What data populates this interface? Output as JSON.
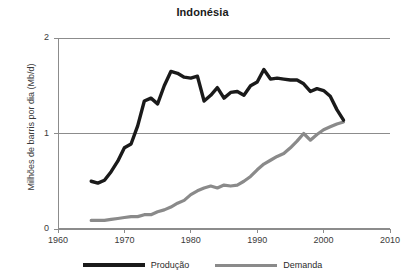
{
  "chart_data": {
    "type": "line",
    "title": "Indonésia",
    "xlabel": "",
    "ylabel": "Milhões de barris por dia (Mb/d)",
    "xlim": [
      1960,
      2010
    ],
    "ylim": [
      0,
      2
    ],
    "xticks": [
      1960,
      1970,
      1980,
      1990,
      2000,
      2010
    ],
    "yticks": [
      0,
      1,
      2
    ],
    "grid": "horizontal gridlines at y = 1 and y = 2 (plot top border)",
    "legend_position": "bottom-center",
    "series": [
      {
        "name": "Produção",
        "color": "#1a1a1a",
        "x": [
          1965,
          1966,
          1967,
          1968,
          1969,
          1970,
          1971,
          1972,
          1973,
          1974,
          1975,
          1976,
          1977,
          1978,
          1979,
          1980,
          1981,
          1982,
          1983,
          1984,
          1985,
          1986,
          1987,
          1988,
          1989,
          1990,
          1991,
          1992,
          1993,
          1994,
          1995,
          1996,
          1997,
          1998,
          1999,
          2000,
          2001,
          2002,
          2003
        ],
        "values": [
          0.5,
          0.48,
          0.51,
          0.6,
          0.71,
          0.85,
          0.89,
          1.08,
          1.34,
          1.37,
          1.31,
          1.5,
          1.65,
          1.63,
          1.59,
          1.58,
          1.6,
          1.34,
          1.4,
          1.48,
          1.37,
          1.43,
          1.44,
          1.4,
          1.5,
          1.54,
          1.67,
          1.57,
          1.58,
          1.57,
          1.56,
          1.56,
          1.52,
          1.44,
          1.47,
          1.45,
          1.39,
          1.25,
          1.14
        ],
        "units": "Mb/d"
      },
      {
        "name": "Demanda",
        "color": "#8a8a8a",
        "x": [
          1965,
          1966,
          1967,
          1968,
          1969,
          1970,
          1971,
          1972,
          1973,
          1974,
          1975,
          1976,
          1977,
          1978,
          1979,
          1980,
          1981,
          1982,
          1983,
          1984,
          1985,
          1986,
          1987,
          1988,
          1989,
          1990,
          1991,
          1992,
          1993,
          1994,
          1995,
          1996,
          1997,
          1998,
          1999,
          2000,
          2001,
          2002,
          2003
        ],
        "values": [
          0.09,
          0.09,
          0.09,
          0.1,
          0.11,
          0.12,
          0.13,
          0.13,
          0.15,
          0.15,
          0.18,
          0.2,
          0.23,
          0.27,
          0.3,
          0.36,
          0.4,
          0.43,
          0.45,
          0.43,
          0.46,
          0.45,
          0.46,
          0.5,
          0.55,
          0.62,
          0.68,
          0.72,
          0.76,
          0.79,
          0.85,
          0.92,
          1.0,
          0.93,
          0.99,
          1.04,
          1.07,
          1.1,
          1.12
        ],
        "units": "Mb/d"
      }
    ]
  },
  "axes": {
    "y_tick_labels": [
      "0",
      "1",
      "2"
    ],
    "x_tick_labels": [
      "1960",
      "1970",
      "1980",
      "1990",
      "2000",
      "2010"
    ],
    "y_axis_title": "Milhões de barris por dia (Mb/d)"
  },
  "title": {
    "text": "Indonésia"
  },
  "legend": {
    "items": [
      {
        "label": "Produção",
        "color": "#1a1a1a"
      },
      {
        "label": "Demanda",
        "color": "#8a8a8a"
      }
    ]
  },
  "colors": {
    "producao": "#1a1a1a",
    "demanda": "#8a8a8a",
    "axis": "#8c8c8c",
    "gridline": "#8c8c8c",
    "background": "#ffffff"
  }
}
